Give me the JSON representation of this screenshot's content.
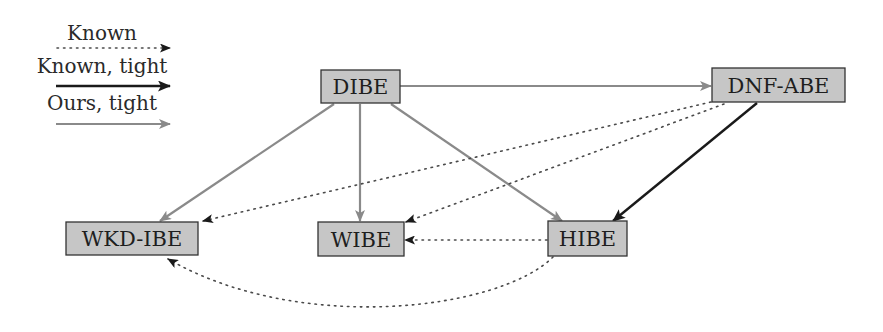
{
  "legend": {
    "items": [
      {
        "label": "Known",
        "style": "dotted",
        "color": "#333333"
      },
      {
        "label": "Known, tight",
        "style": "solid",
        "color": "#1a1a1a"
      },
      {
        "label": "Ours, tight",
        "style": "solid",
        "color": "#8a8a8a"
      }
    ]
  },
  "nodes": {
    "dibe": {
      "label": "DIBE"
    },
    "dnf_abe": {
      "label": "DNF-ABE"
    },
    "wkd_ibe": {
      "label": "WKD-IBE"
    },
    "wibe": {
      "label": "WIBE"
    },
    "hibe": {
      "label": "HIBE"
    }
  },
  "edges": [
    {
      "from": "DIBE",
      "to": "DNF-ABE",
      "type": "Ours, tight"
    },
    {
      "from": "DIBE",
      "to": "WKD-IBE",
      "type": "Ours, tight"
    },
    {
      "from": "DIBE",
      "to": "WIBE",
      "type": "Ours, tight"
    },
    {
      "from": "DIBE",
      "to": "HIBE",
      "type": "Ours, tight"
    },
    {
      "from": "DNF-ABE",
      "to": "HIBE",
      "type": "Known, tight"
    },
    {
      "from": "DNF-ABE",
      "to": "WKD-IBE",
      "type": "Known"
    },
    {
      "from": "DNF-ABE",
      "to": "WIBE",
      "type": "Known"
    },
    {
      "from": "HIBE",
      "to": "WIBE",
      "type": "Known"
    },
    {
      "from": "HIBE",
      "to": "WKD-IBE",
      "type": "Known"
    }
  ],
  "colors": {
    "node_fill": "#c6c6c6",
    "node_border": "#333333",
    "ours_tight": "#8a8a8a",
    "known_tight": "#1a1a1a",
    "known": "#4a4a4a"
  }
}
